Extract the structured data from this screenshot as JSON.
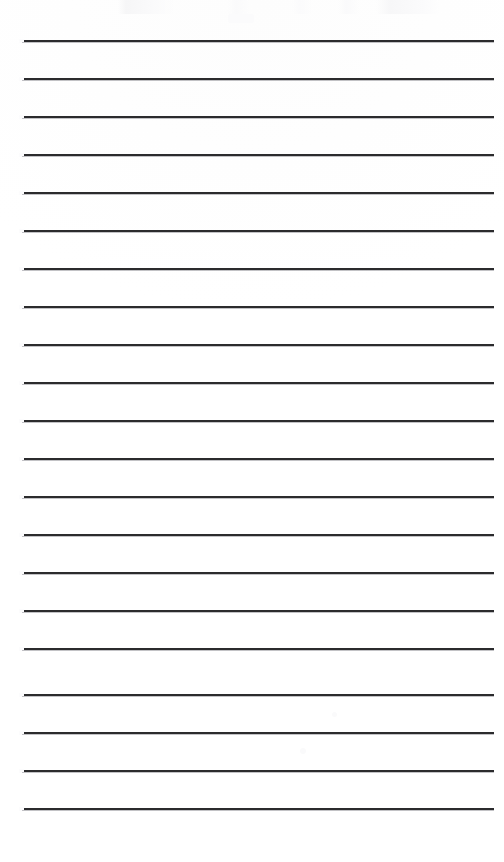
{
  "document": {
    "type": "ruled-notepad-page",
    "title": "Blank ruled notepad page",
    "description": "Scanned blank lined writing paper with horizontal rules and no written content",
    "page_text": "",
    "written_content": [],
    "colors": {
      "paper": "#ffffff",
      "rule": "#2b2b2d",
      "rule_shadow": "#78787e"
    },
    "geometry": {
      "page_width": 504,
      "page_height": 862,
      "line_count": 21,
      "first_line_y": 40,
      "line_spacing": 38,
      "line_left_x": 22,
      "line_right_x": 494,
      "line_width": 472,
      "line_thickness": 2,
      "top_margin": 40,
      "bottom_margin": 54
    },
    "lines": [
      {
        "index": 1,
        "y": 40,
        "text": ""
      },
      {
        "index": 2,
        "y": 78,
        "text": ""
      },
      {
        "index": 3,
        "y": 116,
        "text": ""
      },
      {
        "index": 4,
        "y": 154,
        "text": ""
      },
      {
        "index": 5,
        "y": 192,
        "text": ""
      },
      {
        "index": 6,
        "y": 230,
        "text": ""
      },
      {
        "index": 7,
        "y": 268,
        "text": ""
      },
      {
        "index": 8,
        "y": 306,
        "text": ""
      },
      {
        "index": 9,
        "y": 344,
        "text": ""
      },
      {
        "index": 10,
        "y": 382,
        "text": ""
      },
      {
        "index": 11,
        "y": 420,
        "text": ""
      },
      {
        "index": 12,
        "y": 458,
        "text": ""
      },
      {
        "index": 13,
        "y": 496,
        "text": ""
      },
      {
        "index": 14,
        "y": 534,
        "text": ""
      },
      {
        "index": 15,
        "y": 572,
        "text": ""
      },
      {
        "index": 16,
        "y": 610,
        "text": ""
      },
      {
        "index": 17,
        "y": 648,
        "text": ""
      },
      {
        "index": 18,
        "y": 694,
        "text": ""
      },
      {
        "index": 19,
        "y": 732,
        "text": ""
      },
      {
        "index": 20,
        "y": 770,
        "text": ""
      },
      {
        "index": 21,
        "y": 808,
        "text": ""
      }
    ]
  }
}
